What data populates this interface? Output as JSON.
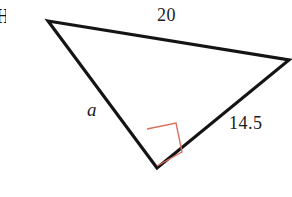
{
  "figure": {
    "background_color": "#ffffff",
    "stroke_color": "#141414",
    "right_angle_color": "#D9705C",
    "stroke_width": 3.2,
    "right_angle_stroke_width": 1.4,
    "vertices": {
      "top_left": {
        "x": 48,
        "y": 21
      },
      "right": {
        "x": 289,
        "y": 60
      },
      "bottom": {
        "x": 157,
        "y": 168
      }
    },
    "right_angle_marker": {
      "at_vertex": "bottom",
      "points": "147,129 176,123 182,152 157,166",
      "size": 30
    },
    "labels": {
      "top_side": "20",
      "right_side": "14.5",
      "left_side": "a",
      "edge_fragment": "H"
    }
  },
  "chart_data": {
    "type": "diagram",
    "shape": "right triangle",
    "sides": [
      {
        "name": "top",
        "label": "20",
        "value": 20,
        "from": "top_left",
        "to": "right",
        "role": "hypotenuse"
      },
      {
        "name": "right",
        "label": "14.5",
        "value": 14.5,
        "from": "right",
        "to": "bottom",
        "role": "leg"
      },
      {
        "name": "left",
        "label": "a",
        "value": null,
        "from": "top_left",
        "to": "bottom",
        "role": "leg-unknown"
      }
    ],
    "angles": [
      {
        "at": "bottom",
        "measure": 90,
        "marked": true,
        "marker": "square"
      }
    ]
  }
}
